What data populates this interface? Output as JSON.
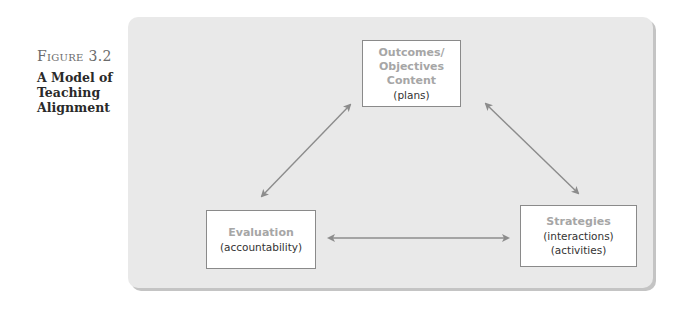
{
  "figure": {
    "label": "Figure 3.2",
    "title": "A Model of Teaching Alignment"
  },
  "diagram": {
    "colors": {
      "panel": "#e9e9e9",
      "panel_shadow": "#c4c4c4",
      "box_border": "#8a8a8a",
      "heading_text": "#a6a6a6",
      "body_text": "#333333",
      "arrow": "#8c8c8c"
    },
    "nodes": {
      "top": {
        "heading_lines": [
          "Outcomes/",
          "Objectives",
          "Content"
        ],
        "detail_lines": [
          "(plans)"
        ]
      },
      "evaluation": {
        "heading_lines": [
          "Evaluation"
        ],
        "detail_lines": [
          "(accountability)"
        ]
      },
      "strategies": {
        "heading_lines": [
          "Strategies"
        ],
        "detail_lines": [
          "(interactions)",
          "(activities)"
        ]
      }
    },
    "edges": [
      {
        "from": "top",
        "to": "evaluation",
        "type": "bidirectional"
      },
      {
        "from": "top",
        "to": "strategies",
        "type": "bidirectional"
      },
      {
        "from": "evaluation",
        "to": "strategies",
        "type": "bidirectional"
      }
    ]
  }
}
